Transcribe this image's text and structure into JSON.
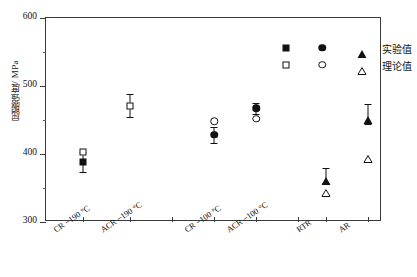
{
  "chart_data": {
    "type": "scatter",
    "title": "",
    "xlabel": "",
    "ylabel": "屈服强度/ MPa",
    "ylim": [
      300,
      600
    ],
    "ytick_labels": [
      "300",
      "400",
      "500",
      "600"
    ],
    "ytick_values": [
      300,
      400,
      500,
      600
    ],
    "yminor_values": [
      350,
      450,
      550
    ],
    "grid": false,
    "legend_position": "top-right",
    "categories": [
      "CR −190 °C",
      "ACR −190 °C",
      "CR −100 °C",
      "ACR −100 °C",
      "RTR",
      "AR"
    ],
    "series": [
      {
        "name": "实验值",
        "marker_fill": "filled",
        "values": [
          388,
          null,
          428,
          467,
          369,
          459
        ],
        "errors": [
          15,
          null,
          12,
          8,
          11,
          15
        ]
      },
      {
        "name": "理论值",
        "marker_fill": "open",
        "values": [
          403,
          471,
          448,
          452,
          352,
          402
        ],
        "errors": [
          null,
          17,
          null,
          null,
          null,
          null
        ]
      }
    ],
    "points": [
      {
        "category": "CR −190 °C",
        "x_frac": 0.111,
        "series": "实验值",
        "marker": "square",
        "fill": "filled",
        "value": 388,
        "err_low": 15,
        "err_high": 15
      },
      {
        "category": "CR −190 °C",
        "x_frac": 0.111,
        "series": "理论值",
        "marker": "square",
        "fill": "open",
        "value": 403,
        "err_low": null,
        "err_high": null
      },
      {
        "category": "ACR −190 °C",
        "x_frac": 0.25,
        "series": "理论值",
        "marker": "square",
        "fill": "open",
        "value": 471,
        "err_low": 17,
        "err_high": 17
      },
      {
        "category": "CR −100 °C",
        "x_frac": 0.5,
        "series": "实验值",
        "marker": "circle",
        "fill": "filled",
        "value": 428,
        "err_low": 12,
        "err_high": 12
      },
      {
        "category": "CR −100 °C",
        "x_frac": 0.5,
        "series": "理论值",
        "marker": "circle",
        "fill": "open",
        "value": 448,
        "err_low": null,
        "err_high": null
      },
      {
        "category": "ACR −100 °C",
        "x_frac": 0.625,
        "series": "实验值",
        "marker": "circle",
        "fill": "filled",
        "value": 467,
        "err_low": 8,
        "err_high": 8
      },
      {
        "category": "ACR −100 °C",
        "x_frac": 0.625,
        "series": "理论值",
        "marker": "circle",
        "fill": "open",
        "value": 452,
        "err_low": null,
        "err_high": null
      },
      {
        "category": "RTR",
        "x_frac": 0.833,
        "series": "实验值",
        "marker": "triangle",
        "fill": "filled",
        "value": 369,
        "err_low": 11,
        "err_high": 11
      },
      {
        "category": "RTR",
        "x_frac": 0.833,
        "series": "理论值",
        "marker": "triangle",
        "fill": "open",
        "value": 352,
        "err_low": null,
        "err_high": null
      },
      {
        "category": "AR",
        "x_frac": 0.958,
        "series": "实验值",
        "marker": "triangle",
        "fill": "filled",
        "value": 459,
        "err_low": 15,
        "err_high": 15
      },
      {
        "category": "AR",
        "x_frac": 0.958,
        "series": "理论值",
        "marker": "triangle",
        "fill": "open",
        "value": 402,
        "err_low": null,
        "err_high": null
      }
    ],
    "xtick_fracs": [
      0.111,
      0.25,
      0.375,
      0.5,
      0.625,
      0.75,
      0.833,
      0.958
    ],
    "xcat_fracs": [
      0.111,
      0.25,
      0.5,
      0.625,
      0.833,
      0.958
    ]
  },
  "legend": {
    "rows": [
      {
        "label": "实验值",
        "fill": "filled",
        "markers": [
          "square",
          "circle",
          "triangle"
        ]
      },
      {
        "label": "理论值",
        "fill": "open",
        "markers": [
          "square",
          "circle",
          "triangle"
        ]
      }
    ]
  },
  "colors": {
    "marker": "#111111",
    "axis": "#3a3a3a",
    "background": "#ffffff"
  }
}
